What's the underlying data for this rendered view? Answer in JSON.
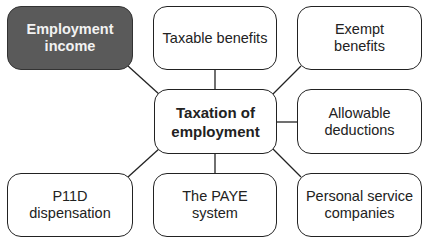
{
  "diagram": {
    "center": {
      "id": "taxation",
      "label": "Taxation of\nemployment"
    },
    "nodes": [
      {
        "id": "employment-income",
        "label": "Employment\nincome",
        "highlighted": true
      },
      {
        "id": "taxable-benefits",
        "label": "Taxable benefits"
      },
      {
        "id": "exempt-benefits",
        "label": "Exempt\nbenefits"
      },
      {
        "id": "allowable-deductions",
        "label": "Allowable\ndeductions"
      },
      {
        "id": "p11d-dispensation",
        "label": "P11D\ndispensation"
      },
      {
        "id": "paye-system",
        "label": "The PAYE system"
      },
      {
        "id": "personal-service-companies",
        "label": "Personal service\ncompanies"
      }
    ],
    "edges": [
      [
        "taxation",
        "employment-income"
      ],
      [
        "taxation",
        "taxable-benefits"
      ],
      [
        "taxation",
        "exempt-benefits"
      ],
      [
        "taxation",
        "allowable-deductions"
      ],
      [
        "taxation",
        "p11d-dispensation"
      ],
      [
        "taxation",
        "paye-system"
      ],
      [
        "taxation",
        "personal-service-companies"
      ]
    ],
    "colors": {
      "highlight_fill": "#5a5a5a",
      "stroke": "#222222"
    }
  }
}
